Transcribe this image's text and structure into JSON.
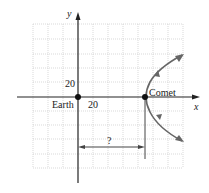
{
  "diagram": {
    "axes": {
      "x_label": "x",
      "y_label": "y"
    },
    "ticks": {
      "x_tick": "20",
      "y_tick": "20"
    },
    "points": {
      "earth": {
        "label": "Earth"
      },
      "comet": {
        "label": "Comet"
      }
    },
    "distance_label": "?",
    "colors": {
      "curve": "#666666",
      "axis": "#222222",
      "grid": "#c8c8c8"
    }
  }
}
